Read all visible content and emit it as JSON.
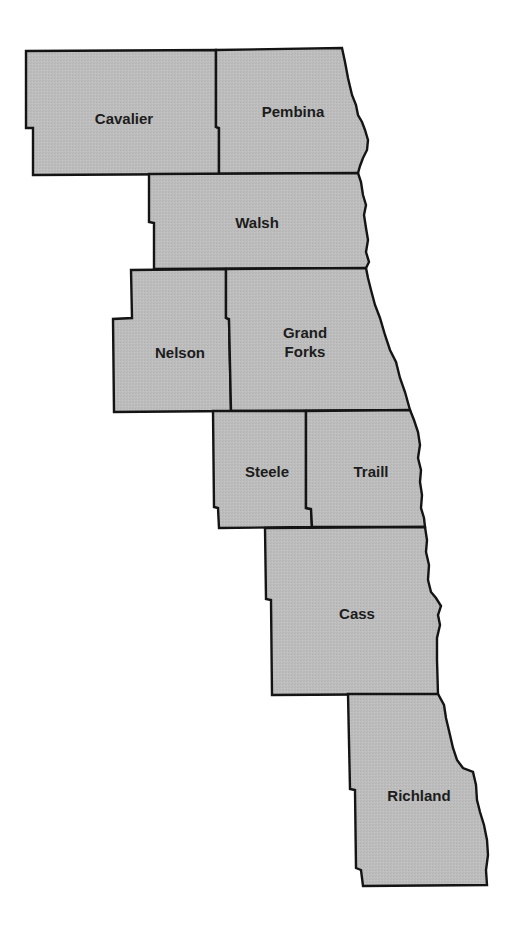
{
  "map": {
    "title": "",
    "fill_color": "#bdbdbd",
    "stroke_color": "#141414",
    "label_color": "#1c1c1c",
    "counties": [
      {
        "name": "Cavalier",
        "label_lines": [
          "Cavalier"
        ]
      },
      {
        "name": "Pembina",
        "label_lines": [
          "Pembina"
        ]
      },
      {
        "name": "Walsh",
        "label_lines": [
          "Walsh"
        ]
      },
      {
        "name": "Nelson",
        "label_lines": [
          "Nelson"
        ]
      },
      {
        "name": "Grand Forks",
        "label_lines": [
          "Grand",
          "Forks"
        ]
      },
      {
        "name": "Steele",
        "label_lines": [
          "Steele"
        ]
      },
      {
        "name": "Traill",
        "label_lines": [
          "Traill"
        ]
      },
      {
        "name": "Cass",
        "label_lines": [
          "Cass"
        ]
      },
      {
        "name": "Richland",
        "label_lines": [
          "Richland"
        ]
      }
    ]
  }
}
